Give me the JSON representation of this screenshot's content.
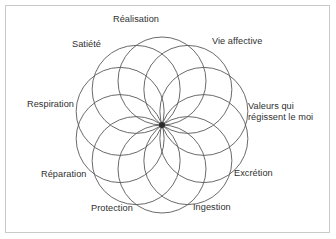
{
  "figure": {
    "type": "rosette-diagram",
    "title": "",
    "frame_color": "#c9c9c9",
    "background_color": "#ffffff",
    "stroke_color": "#59595b",
    "text_color": "#2f2f2f",
    "center": {
      "x": 162,
      "y": 125
    },
    "circle_count": 10,
    "circle_radius": 44,
    "center_ring_radius": 44,
    "hub": {
      "label": "",
      "radius": 3
    },
    "nodes": [
      {
        "id": "realisation",
        "label": "Réalisation",
        "angle_deg": 90,
        "lines": [
          "Réalisation"
        ]
      },
      {
        "id": "vie-affective",
        "label": "Vie affective",
        "angle_deg": 54,
        "lines": [
          "Vie affective"
        ]
      },
      {
        "id": "valeurs",
        "label": "Valeurs qui régissent le moi",
        "angle_deg": 18,
        "lines": [
          "Valeurs qui",
          "régissent le moi"
        ]
      },
      {
        "id": "excretion",
        "label": "Excrétion",
        "angle_deg": -18,
        "lines": [
          "Excrétion"
        ]
      },
      {
        "id": "ingestion",
        "label": "Ingestion",
        "angle_deg": -54,
        "lines": [
          "Ingestion"
        ]
      },
      {
        "id": "protection",
        "label": "Protection",
        "angle_deg": -90,
        "lines": [
          "Protection"
        ]
      },
      {
        "id": "reparation",
        "label": "Réparation",
        "angle_deg": -126,
        "lines": [
          "Réparation"
        ]
      },
      {
        "id": "respiration",
        "label": "Respiration",
        "angle_deg": 180,
        "lines": [
          "Respiration"
        ]
      },
      {
        "id": "satiete",
        "label": "Satiété",
        "angle_deg": 126,
        "lines": [
          "Satiété"
        ]
      }
    ],
    "labels": {
      "realisation": "Réalisation",
      "vie_affective": "Vie affective",
      "valeurs_line1": "Valeurs qui",
      "valeurs_line2": "régissent le moi",
      "excretion": "Excrétion",
      "ingestion": "Ingestion",
      "protection": "Protection",
      "reparation": "Réparation",
      "respiration": "Respiration",
      "satiete": "Satiété"
    }
  }
}
